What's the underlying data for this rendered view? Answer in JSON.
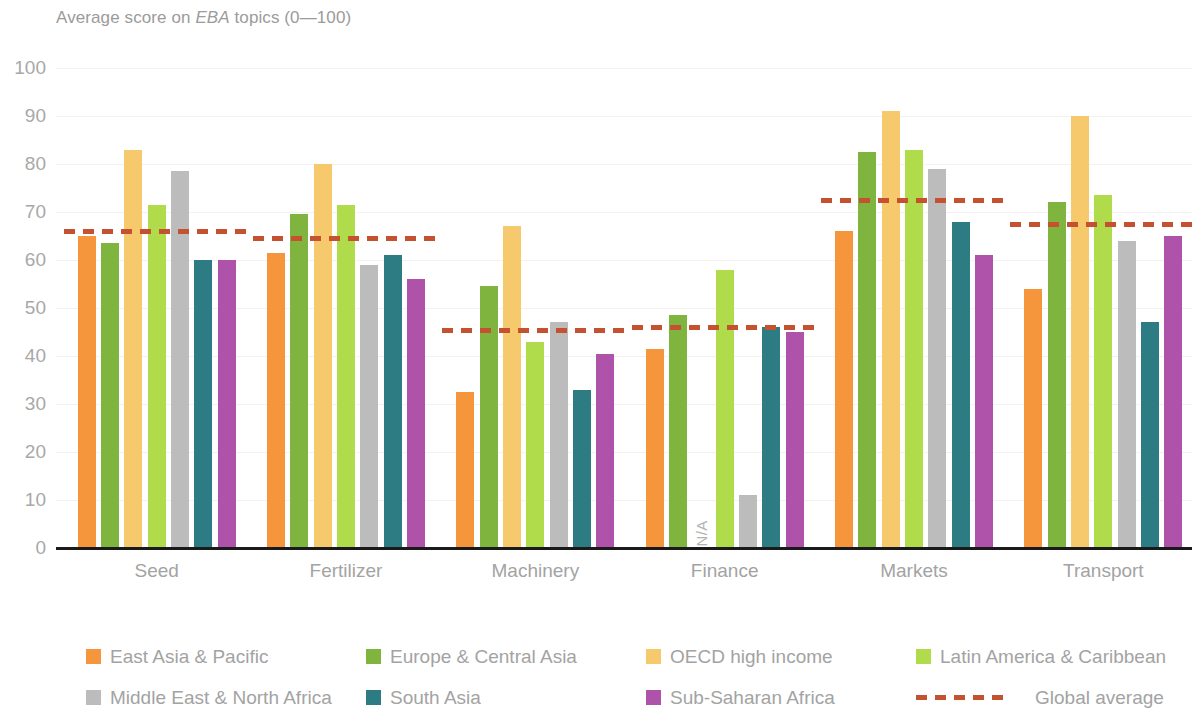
{
  "title": {
    "prefix": "Average score on ",
    "emphasis": "EBA",
    "suffix": " topics (0—100)"
  },
  "axis": {
    "y_ticks": [
      "100",
      "90",
      "80",
      "70",
      "60",
      "50",
      "40",
      "30",
      "20",
      "10",
      "0"
    ],
    "y_min": 0,
    "y_max": 100
  },
  "legend": {
    "items": [
      {
        "label": "East Asia & Pacific",
        "color": "#F5963C"
      },
      {
        "label": "Europe & Central Asia",
        "color": "#7FB53F"
      },
      {
        "label": "OECD high income",
        "color": "#F7C96D"
      },
      {
        "label": "Latin America & Caribbean",
        "color": "#B0DC4C"
      },
      {
        "label": "Middle East & North Africa",
        "color": "#BCBCBC"
      },
      {
        "label": "South Asia",
        "color": "#2D7C83"
      },
      {
        "label": "Sub-Saharan Africa",
        "color": "#AE53A9"
      }
    ],
    "average": {
      "label": "Global average",
      "color": "#C4512F",
      "style": "dashed"
    }
  },
  "na_label": "N/A",
  "chart_data": {
    "type": "bar",
    "title": "Average score on EBA topics (0—100)",
    "xlabel": "",
    "ylabel": "",
    "ylim": [
      0,
      100
    ],
    "grid": true,
    "legend_position": "bottom",
    "categories": [
      "Seed",
      "Fertilizer",
      "Machinery",
      "Finance",
      "Markets",
      "Transport"
    ],
    "series": [
      {
        "name": "East Asia & Pacific",
        "color": "#F5963C",
        "values": [
          65,
          61.5,
          32.5,
          41.5,
          66,
          54
        ]
      },
      {
        "name": "Europe & Central Asia",
        "color": "#7FB53F",
        "values": [
          63.5,
          69.5,
          54.5,
          48.5,
          82.5,
          72
        ]
      },
      {
        "name": "OECD high income",
        "color": "#F7C96D",
        "values": [
          83,
          80,
          67,
          null,
          91,
          90
        ]
      },
      {
        "name": "Latin America & Caribbean",
        "color": "#B0DC4C",
        "values": [
          71.5,
          71.5,
          43,
          58,
          83,
          73.5
        ]
      },
      {
        "name": "Middle East & North Africa",
        "color": "#BCBCBC",
        "values": [
          78.5,
          59,
          47,
          11,
          79,
          64
        ]
      },
      {
        "name": "South Asia",
        "color": "#2D7C83",
        "values": [
          60,
          61,
          33,
          46,
          68,
          47
        ]
      },
      {
        "name": "Sub-Saharan Africa",
        "color": "#AE53A9",
        "values": [
          60,
          56,
          40.5,
          45,
          61,
          65
        ]
      }
    ],
    "global_average": {
      "name": "Global average",
      "color": "#C4512F",
      "values": [
        66,
        64.5,
        45.5,
        46,
        72.5,
        67.5
      ]
    }
  }
}
